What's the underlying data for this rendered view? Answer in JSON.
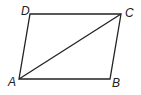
{
  "diagram": {
    "type": "parallelogram",
    "stroke_color": "#222222",
    "vertices": {
      "A": {
        "label": "A",
        "x": 19,
        "y": 79
      },
      "B": {
        "label": "B",
        "x": 110,
        "y": 79
      },
      "C": {
        "label": "C",
        "x": 121,
        "y": 14
      },
      "D": {
        "label": "D",
        "x": 30,
        "y": 14
      }
    },
    "edges": [
      "AB",
      "BC",
      "CD",
      "DA"
    ],
    "diagonals": [
      "AC"
    ]
  }
}
